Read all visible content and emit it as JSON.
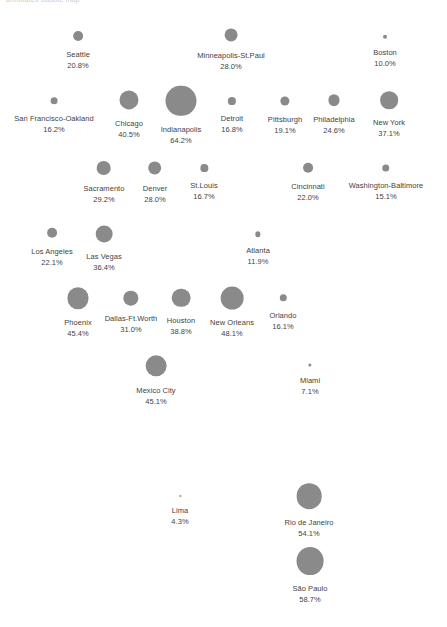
{
  "page": {
    "title_fragment": "annotated bubble map",
    "footer_fragment": "",
    "background": "#ffffff"
  },
  "style": {
    "bubble_color": "#8a8a8a",
    "text_color": "#3f3f3f"
  },
  "chart_data": {
    "type": "scatter",
    "title": "",
    "subtitle": "",
    "xlabel": "",
    "ylabel": "",
    "legend": "none",
    "grid": false,
    "value_suffix": "%",
    "size_encoding": "bubble radius proportional to value",
    "categories": [
      "Seattle",
      "Minneapolis-St.Paul",
      "Boston",
      "San Francisco-Oakland",
      "Chicago",
      "Indianapolis",
      "Detroit",
      "Pittsburgh",
      "Philadelphia",
      "New York",
      "Sacramento",
      "Denver",
      "St.Louis",
      "Cincinnati",
      "Washington-Baltimore",
      "Los Angeles",
      "Las Vegas",
      "Atlanta",
      "Phoenix",
      "Dallas-Ft.Worth",
      "Houston",
      "New Orleans",
      "Orlando",
      "Mexico City",
      "Miami",
      "Lima",
      "Rio de Janeiro",
      "São Paulo"
    ],
    "values": [
      20.8,
      28.0,
      10.0,
      16.2,
      40.5,
      64.2,
      16.8,
      19.1,
      24.6,
      37.1,
      29.2,
      28.0,
      16.7,
      22.0,
      15.1,
      22.1,
      36.4,
      11.9,
      45.4,
      31.0,
      38.8,
      48.1,
      16.1,
      45.1,
      7.1,
      4.3,
      54.1,
      58.7
    ],
    "points": [
      {
        "label": "Seattle",
        "value": "20.8%",
        "x": 78,
        "y": 36,
        "r": 5.0
      },
      {
        "label": "Minneapolis-St.Paul",
        "value": "28.0%",
        "x": 231,
        "y": 35,
        "r": 6.6
      },
      {
        "label": "Boston",
        "value": "10.0%",
        "x": 385,
        "y": 37,
        "r": 2.2
      },
      {
        "label": "San Francisco-Oakland",
        "value": "16.2%",
        "x": 54,
        "y": 101,
        "r": 3.7
      },
      {
        "label": "Chicago",
        "value": "40.5%",
        "x": 129,
        "y": 100,
        "r": 9.6
      },
      {
        "label": "Indianapolis",
        "value": "64.2%",
        "x": 181,
        "y": 101,
        "r": 15.2
      },
      {
        "label": "Detroit",
        "value": "16.8%",
        "x": 232,
        "y": 101,
        "r": 3.9
      },
      {
        "label": "Pittsburgh",
        "value": "19.1%",
        "x": 285,
        "y": 101,
        "r": 4.5
      },
      {
        "label": "Philadelphia",
        "value": "24.6%",
        "x": 334,
        "y": 100,
        "r": 5.8
      },
      {
        "label": "New York",
        "value": "37.1%",
        "x": 389,
        "y": 100,
        "r": 8.8
      },
      {
        "label": "Sacramento",
        "value": "29.2%",
        "x": 104,
        "y": 168,
        "r": 6.9
      },
      {
        "label": "Denver",
        "value": "28.0%",
        "x": 155,
        "y": 168,
        "r": 6.6
      },
      {
        "label": "St.Louis",
        "value": "16.7%",
        "x": 204,
        "y": 168,
        "r": 3.9
      },
      {
        "label": "Cincinnati",
        "value": "22.0%",
        "x": 308,
        "y": 168,
        "r": 5.2
      },
      {
        "label": "Washington-Baltimore",
        "value": "15.1%",
        "x": 386,
        "y": 168,
        "r": 3.5
      },
      {
        "label": "Los Angeles",
        "value": "22.1%",
        "x": 52,
        "y": 233,
        "r": 5.2
      },
      {
        "label": "Las Vegas",
        "value": "36.4%",
        "x": 104,
        "y": 234,
        "r": 8.6
      },
      {
        "label": "Atlanta",
        "value": "11.9%",
        "x": 258,
        "y": 234,
        "r": 2.8
      },
      {
        "label": "Phoenix",
        "value": "45.4%",
        "x": 78,
        "y": 298,
        "r": 10.8
      },
      {
        "label": "Dallas-Ft.Worth",
        "value": "31.0%",
        "x": 131,
        "y": 298,
        "r": 7.3
      },
      {
        "label": "Houston",
        "value": "38.8%",
        "x": 181,
        "y": 298,
        "r": 9.2
      },
      {
        "label": "New Orleans",
        "value": "48.1%",
        "x": 232,
        "y": 298,
        "r": 11.4
      },
      {
        "label": "Orlando",
        "value": "16.1%",
        "x": 283,
        "y": 298,
        "r": 3.7
      },
      {
        "label": "Mexico City",
        "value": "45.1%",
        "x": 156,
        "y": 366,
        "r": 10.7
      },
      {
        "label": "Miami",
        "value": "7.1%",
        "x": 310,
        "y": 365,
        "r": 1.5
      },
      {
        "label": "Lima",
        "value": "4.3%",
        "x": 180,
        "y": 496,
        "r": 1.0
      },
      {
        "label": "Rio de Janeiro",
        "value": "54.1%",
        "x": 309,
        "y": 496,
        "r": 12.8
      },
      {
        "label": "São Paulo",
        "value": "58.7%",
        "x": 310,
        "y": 561,
        "r": 13.9
      }
    ]
  }
}
